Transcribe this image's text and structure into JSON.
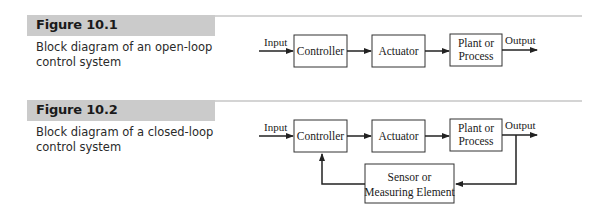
{
  "figures": [
    {
      "label": "Figure 10.1",
      "caption_lines": [
        "Block diagram of an open-loop",
        "control system"
      ],
      "diagram": {
        "type": "open-loop",
        "input_label": "Input",
        "output_label": "Output",
        "blocks": [
          {
            "lines": [
              "Controller"
            ]
          },
          {
            "lines": [
              "Actuator"
            ]
          },
          {
            "lines": [
              "Plant or",
              "Process"
            ]
          }
        ]
      }
    },
    {
      "label": "Figure 10.2",
      "caption_lines": [
        "Block diagram of a closed-loop",
        "control system"
      ],
      "diagram": {
        "type": "closed-loop",
        "input_label": "Input",
        "output_label": "Output",
        "blocks": [
          {
            "lines": [
              "Controller"
            ]
          },
          {
            "lines": [
              "Actuator"
            ]
          },
          {
            "lines": [
              "Plant or",
              "Process"
            ]
          }
        ],
        "feedback_block": {
          "lines": [
            "Sensor or",
            "Measuring Element"
          ]
        }
      }
    }
  ]
}
